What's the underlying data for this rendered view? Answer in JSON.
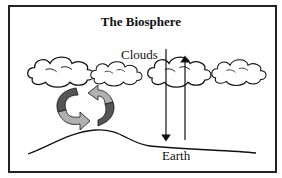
{
  "diagram": {
    "title": "The Biosphere",
    "labels": {
      "clouds": "Clouds",
      "earth": "Earth"
    },
    "elements": {
      "clouds_count": 4,
      "cycle_arrows": [
        "dark-gray-arrow",
        "light-gray-arrow"
      ],
      "vertical_arrows": [
        {
          "direction": "down",
          "from": "Clouds",
          "to": "Earth"
        },
        {
          "direction": "up",
          "from": "Earth",
          "to": "Clouds"
        }
      ]
    },
    "colors": {
      "border": "#222222",
      "dark_arrow": "#555555",
      "light_arrow": "#b0b0b0",
      "line": "#111111"
    }
  }
}
